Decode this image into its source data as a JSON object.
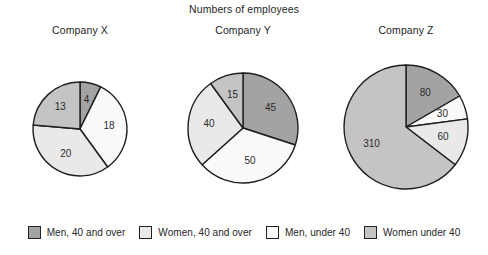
{
  "chart_data": {
    "type": "pie",
    "title": "Numbers of employees",
    "xlabel": "",
    "ylabel": "",
    "legend_position": "bottom",
    "grid": false,
    "categories": [
      "Men, 40 and over",
      "Men, under 40",
      "Women, 40 and over",
      "Women under 40"
    ],
    "category_colors": [
      "#a3a3a3",
      "#fafafa",
      "#e9e9e9",
      "#c4c4c4"
    ],
    "panels": [
      {
        "name": "Company X",
        "total": 55,
        "center_x": 80,
        "center_y": 129,
        "radius": 47,
        "values": [
          4,
          18,
          20,
          13
        ],
        "labels": [
          "4",
          "18",
          "20",
          "13"
        ]
      },
      {
        "name": "Company Y",
        "total": 150,
        "center_x": 243,
        "center_y": 128,
        "radius": 55,
        "values": [
          45,
          50,
          40,
          15
        ],
        "labels": [
          "45",
          "50",
          "40",
          "15"
        ]
      },
      {
        "name": "Company Z",
        "total": 480,
        "center_x": 406,
        "center_y": 127,
        "radius": 62,
        "values": [
          80,
          30,
          60,
          310
        ],
        "labels": [
          "80",
          "30",
          "60",
          "310"
        ]
      }
    ]
  },
  "figure": {
    "title": "Numbers of employees",
    "panel_titles": [
      "Company X",
      "Company Y",
      "Company Z"
    ],
    "legend": [
      {
        "label": "Men, 40 and over",
        "color": "#a3a3a3"
      },
      {
        "label": "Women, 40 and over",
        "color": "#e9e9e9"
      },
      {
        "label": "Men, under 40",
        "color": "#fafafa"
      },
      {
        "label": "Women under 40",
        "color": "#c4c4c4"
      }
    ]
  }
}
